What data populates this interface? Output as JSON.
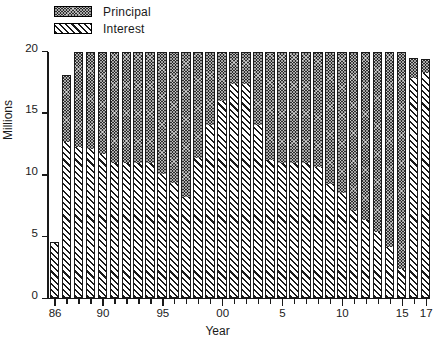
{
  "chart_data": {
    "type": "bar",
    "subtype": "stacked",
    "title": "",
    "xlabel": "Year",
    "ylabel": "Millions",
    "ylim": [
      0,
      20
    ],
    "yticks": [
      0,
      5,
      10,
      15,
      20
    ],
    "grid": false,
    "legend_position": "top-left",
    "categories": [
      "86",
      "87",
      "88",
      "89",
      "90",
      "91",
      "92",
      "93",
      "94",
      "95",
      "96",
      "97",
      "98",
      "99",
      "00",
      "01",
      "02",
      "03",
      "04",
      "5",
      "6",
      "7",
      "8",
      "9",
      "10",
      "11",
      "12",
      "13",
      "14",
      "15",
      "16",
      "17"
    ],
    "xtick_labels": [
      "86",
      "90",
      "95",
      "00",
      "5",
      "10",
      "15",
      "17"
    ],
    "xtick_categories": [
      "86",
      "90",
      "95",
      "00",
      "5",
      "10",
      "15",
      "17"
    ],
    "series": [
      {
        "name": "Interest",
        "fill": "diagonal-hatch",
        "values": [
          4.5,
          12.6,
          12.2,
          12.0,
          11.6,
          10.9,
          10.9,
          10.9,
          10.9,
          10.0,
          9.3,
          8.1,
          11.3,
          14.0,
          15.9,
          17.3,
          17.3,
          14.0,
          11.1,
          10.9,
          10.9,
          10.9,
          10.6,
          9.2,
          8.5,
          7.0,
          6.3,
          5.3,
          4.1,
          2.3,
          17.8,
          18.2
        ]
      },
      {
        "name": "Principal",
        "fill": "cross-hatch-dark",
        "values": [
          0.0,
          5.4,
          7.7,
          7.9,
          8.3,
          9.0,
          9.0,
          9.0,
          9.0,
          9.9,
          10.6,
          11.8,
          8.6,
          5.9,
          4.0,
          2.6,
          2.6,
          5.9,
          8.8,
          9.0,
          9.0,
          9.0,
          9.3,
          10.7,
          11.4,
          12.9,
          13.6,
          14.6,
          15.8,
          17.6,
          1.6,
          1.1
        ]
      }
    ],
    "totals": [
      4.5,
      18.0,
      19.9,
      19.9,
      19.9,
      19.9,
      19.9,
      19.9,
      19.9,
      19.9,
      19.9,
      19.9,
      19.9,
      19.9,
      19.9,
      19.9,
      19.9,
      19.9,
      19.9,
      19.9,
      19.9,
      19.9,
      19.9,
      19.9,
      19.9,
      19.9,
      19.9,
      19.9,
      19.9,
      19.9,
      19.4,
      19.3
    ]
  },
  "legend": {
    "items": [
      {
        "label": "Principal",
        "swatch": "cross-hatch-dark"
      },
      {
        "label": "Interest",
        "swatch": "diagonal-hatch"
      }
    ]
  },
  "axes": {
    "y_title": "Millions",
    "x_title": "Year"
  }
}
